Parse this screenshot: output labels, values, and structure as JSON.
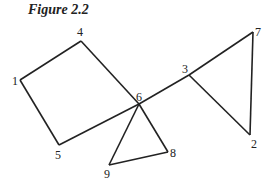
{
  "title": "Figure 2.2",
  "nodes": [
    {
      "id": "1",
      "label": "1",
      "x": 20,
      "y": 80,
      "lx": 12,
      "ly": 85
    },
    {
      "id": "4",
      "label": "4",
      "x": 81,
      "y": 41,
      "lx": 77,
      "ly": 36
    },
    {
      "id": "6",
      "label": "6",
      "x": 139,
      "y": 104,
      "lx": 136,
      "ly": 101
    },
    {
      "id": "5",
      "label": "5",
      "x": 59,
      "y": 145,
      "lx": 55,
      "ly": 159
    },
    {
      "id": "3",
      "label": "3",
      "x": 189,
      "y": 75,
      "lx": 182,
      "ly": 73
    },
    {
      "id": "7",
      "label": "7",
      "x": 253,
      "y": 32,
      "lx": 255,
      "ly": 36
    },
    {
      "id": "2",
      "label": "2",
      "x": 250,
      "y": 135,
      "lx": 251,
      "ly": 148
    },
    {
      "id": "8",
      "label": "8",
      "x": 168,
      "y": 152,
      "lx": 170,
      "ly": 157
    },
    {
      "id": "9",
      "label": "9",
      "x": 109,
      "y": 165,
      "lx": 104,
      "ly": 178
    }
  ],
  "edges": [
    [
      "1",
      "4"
    ],
    [
      "4",
      "6"
    ],
    [
      "1",
      "5"
    ],
    [
      "5",
      "6"
    ],
    [
      "6",
      "3"
    ],
    [
      "3",
      "7"
    ],
    [
      "7",
      "2"
    ],
    [
      "3",
      "2"
    ],
    [
      "6",
      "8"
    ],
    [
      "6",
      "9"
    ],
    [
      "9",
      "8"
    ]
  ]
}
